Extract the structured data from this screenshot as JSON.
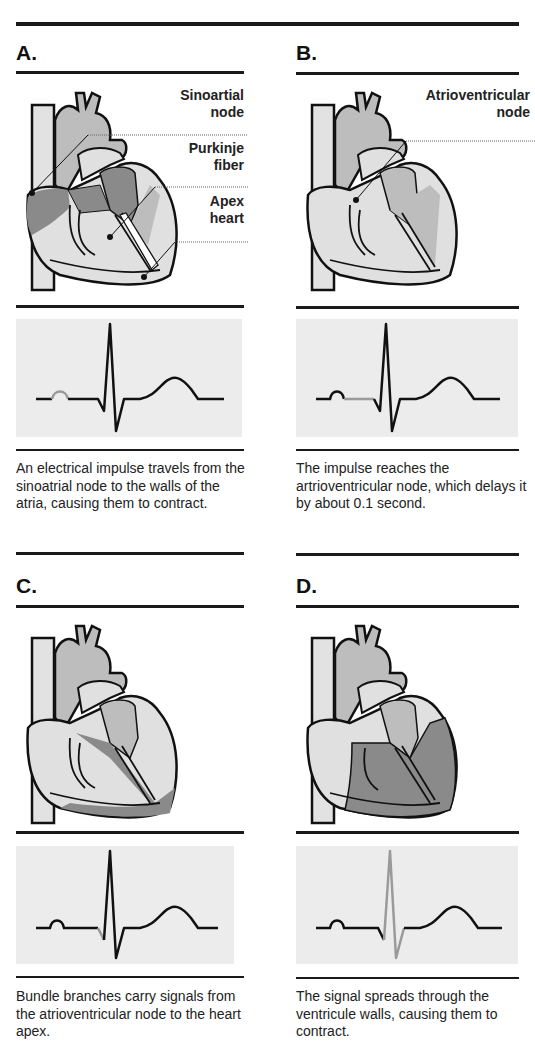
{
  "title_fragment": "...y...",
  "colors": {
    "rule": "#1a1a1a",
    "ecg_bg": "#ececec",
    "heart_dark": "#8a8a8a",
    "heart_mid": "#b9b9b9",
    "heart_light": "#dedede",
    "highlight_wave": "#9a9a9a"
  },
  "panels": [
    {
      "letter": "A.",
      "labels": [
        {
          "line1": "Sinoartial",
          "line2": "node"
        },
        {
          "line1": "Purkinje",
          "line2": "fiber"
        },
        {
          "line1": "Apex",
          "line2": "heart"
        }
      ],
      "highlighted_ecg_segment": "P wave",
      "caption": "An electrical impulse travels from the sinoatrial node to the walls of the atria, causing them to contract."
    },
    {
      "letter": "B.",
      "labels": [
        {
          "line1": "Atrioventricular",
          "line2": "node"
        }
      ],
      "highlighted_ecg_segment": "PR segment",
      "caption": "The impulse reaches the artrioventricular node, which delays it by about 0.1 second."
    },
    {
      "letter": "C.",
      "labels": [],
      "highlighted_ecg_segment": "Q wave",
      "caption": "Bundle branches carry signals from the atrioventricular node to the heart apex."
    },
    {
      "letter": "D.",
      "labels": [],
      "highlighted_ecg_segment": "QRS complex",
      "caption": "The signal spreads through the ventricule walls, causing them to contract."
    }
  ]
}
